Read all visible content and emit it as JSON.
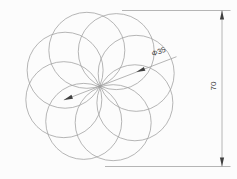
{
  "drawing": {
    "title": "circle-rosette-technical-drawing",
    "background_color": "#fcfcfc",
    "line_color": "#9e9e9e",
    "accent_color": "#3f3f3f",
    "rosette": {
      "circle_count": 8,
      "center_x": 100,
      "center_y": 86.5,
      "pitch_radius": 38.5,
      "circle_radius": 38,
      "start_angle_deg": 20,
      "step_angle_deg": 45
    },
    "dimensions": {
      "diameter": {
        "label": "Φ35"
      },
      "height": {
        "label": "70"
      }
    }
  }
}
